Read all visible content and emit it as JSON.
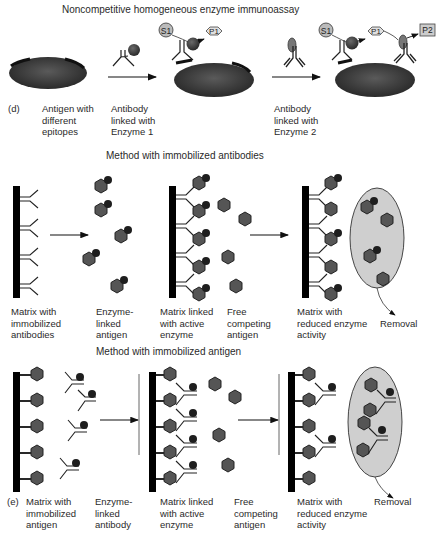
{
  "panel_d": {
    "tag": "(d)",
    "title": "Noncompetitive homogeneous enzyme immunoassay",
    "labels": {
      "antigen": "Antigen with\ndifferent\nepitopes",
      "antibody1": "Antibody\nlinked with\nEnzyme 1",
      "antibody2": "Antibody\nlinked with\nEnzyme 2"
    },
    "nodes": {
      "s1a": "S1",
      "p1a": "P1",
      "s1b": "S1",
      "p1b": "P1",
      "p2": "P2"
    }
  },
  "section_antibodies": {
    "title": "Method with immobilized antibodies",
    "labels": [
      "Matrix with\nimmobilized\nantibodies",
      "Enzyme-\nlinked\nantigen",
      "Matrix linked\nwith active\nenzyme",
      "Free\ncompeting\nantigen",
      "Matrix with\nreduced enzyme\nactivity",
      "Removal"
    ]
  },
  "section_antigen": {
    "tag": "(e)",
    "title": "Method with immobilized antigen",
    "labels": [
      "Matrix with\nimmobilized\nantigen",
      "Enzyme-\nlinked\nantibody",
      "Matrix linked\nwith active\nenzyme",
      "Free\ncompeting\nantigen",
      "Matrix with\nreduced enzyme\nactivity",
      "Removal"
    ]
  },
  "colors": {
    "antigen_body": "#3a3a3a",
    "hexagon": "#555555",
    "enzyme": "#2b2b2b",
    "removal_fill": "#cfcfcf",
    "node_fill": "#cccccc"
  }
}
